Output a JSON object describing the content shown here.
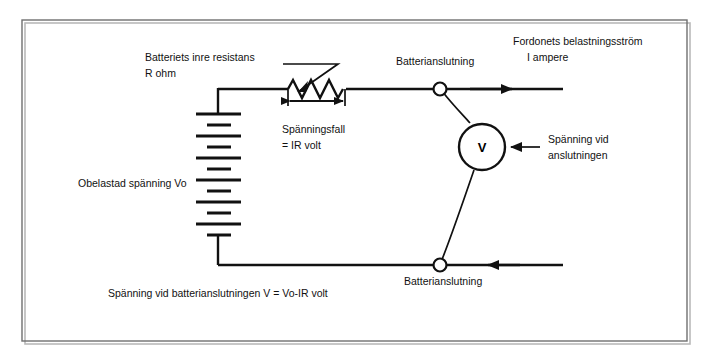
{
  "figure": {
    "title_text": "",
    "background_color": "#ffffff",
    "line_color": "#111111",
    "frame_color": "#6f6f6f"
  },
  "labels": {
    "internal_resistance_line1": "Batteriets inre resistans",
    "internal_resistance_line2": "R ohm",
    "voltage_drop_line1": "Spänningsfall",
    "voltage_drop_line2": "= IR volt",
    "open_circuit_voltage": "Obelastad spänning Vo",
    "battery_terminal_top": "Batterianslutning",
    "battery_terminal_bottom": "Batterianslutning",
    "load_current_line1": "Fordonets belastningsström",
    "load_current_line2": "I ampere",
    "terminal_voltage_line1": "Spänning vid",
    "terminal_voltage_line2": "anslutningen",
    "formula": "Spänning vid batterianslutningen V = Vo-IR volt",
    "meter_symbol": "V"
  },
  "components": {
    "battery": {
      "name": "battery-symbol",
      "plate_count": 10,
      "plate_pattern": [
        "long",
        "short",
        "long",
        "short",
        "long",
        "short",
        "long",
        "short",
        "long",
        "short"
      ]
    },
    "resistor": {
      "name": "variable-resistor-symbol",
      "type": "rheostat",
      "zigzag_peaks": 3
    },
    "voltmeter": {
      "name": "voltmeter-symbol",
      "reading_label": "V"
    },
    "terminals": [
      {
        "name": "battery-terminal-top-node"
      },
      {
        "name": "battery-terminal-bottom-node"
      }
    ],
    "arrows": [
      {
        "name": "load-current-arrow",
        "direction": "right"
      },
      {
        "name": "return-current-arrow",
        "direction": "left"
      },
      {
        "name": "voltage-drop-dimension-arrow",
        "direction": "both"
      },
      {
        "name": "terminal-voltage-pointer-arrow",
        "direction": "left"
      }
    ]
  }
}
